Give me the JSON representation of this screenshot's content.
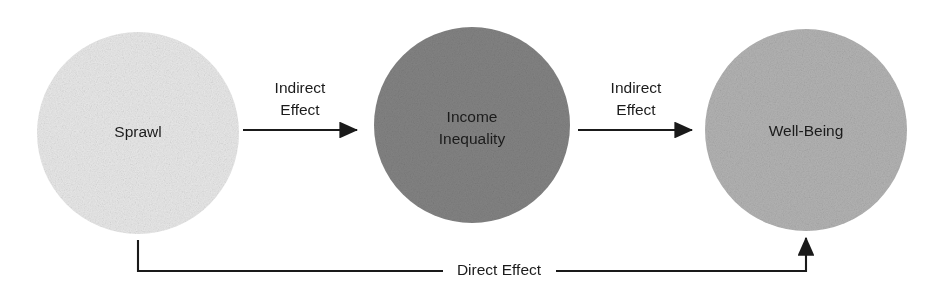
{
  "diagram": {
    "type": "mediation-path-diagram",
    "title": "",
    "background_color": "#ffffff",
    "line_color": "#1a1a1a",
    "text_color": "#1b1b1b",
    "nodes": [
      {
        "id": "sprawl",
        "label": "Sprawl",
        "label_lines": [
          "Sprawl"
        ],
        "shape": "circle",
        "fill": "#e8e8e8",
        "cx": 138,
        "cy": 133,
        "r": 101
      },
      {
        "id": "income_inequality",
        "label": "Income Inequality",
        "label_lines": [
          "Income",
          "Inequality"
        ],
        "shape": "circle",
        "fill": "#7f7f7f",
        "cx": 472,
        "cy": 125,
        "r": 98
      },
      {
        "id": "well_being",
        "label": "Well-Being",
        "label_lines": [
          "Well-Being"
        ],
        "shape": "circle",
        "fill": "#b0b0b0",
        "cx": 806,
        "cy": 130,
        "r": 101
      }
    ],
    "edges": [
      {
        "id": "sprawl-to-income",
        "label": "Indirect Effect",
        "label_lines": [
          "Indirect",
          "Effect"
        ],
        "from": "sprawl",
        "to": "income_inequality",
        "direction": "right"
      },
      {
        "id": "income-to-wellbeing",
        "label": "Indirect Effect",
        "label_lines": [
          "Indirect",
          "Effect"
        ],
        "from": "income_inequality",
        "to": "well_being",
        "direction": "right"
      },
      {
        "id": "sprawl-to-wellbeing",
        "label": "Direct Effect",
        "label_lines": [
          "Direct Effect"
        ],
        "from": "sprawl",
        "to": "well_being",
        "direction": "up"
      }
    ]
  }
}
